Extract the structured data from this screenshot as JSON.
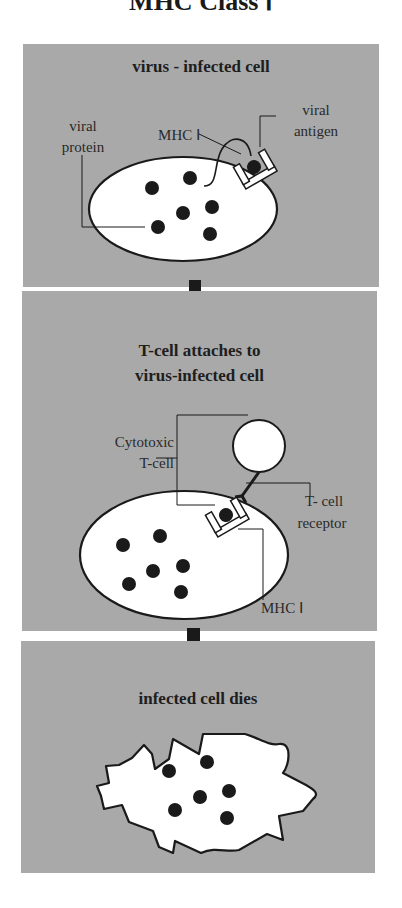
{
  "title": "MHC Class Ⅰ",
  "panels": [
    {
      "heading": "virus - infected cell",
      "labels": {
        "viral_protein": "viral protein",
        "mhc": "MHC Ⅰ",
        "viral_antigen": "viral antigen"
      }
    },
    {
      "heading_line1": "T-cell attaches to",
      "heading_line2": "virus-infected cell",
      "labels": {
        "cytotoxic_1": "Cytotoxic",
        "cytotoxic_2": "T-cell",
        "receptor_1": "T- cell",
        "receptor_2": "receptor",
        "mhc": "MHC Ⅰ"
      }
    },
    {
      "heading": "infected cell dies"
    }
  ],
  "colors": {
    "panel_bg": "#a9a9a9",
    "cell_fill": "#ffffff",
    "outline": "#1a1a1a",
    "arrow": "#1a1a1a"
  }
}
